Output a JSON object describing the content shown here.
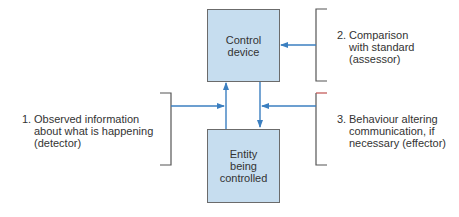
{
  "diagram": {
    "boxes": {
      "control": {
        "label": "Control\ndevice",
        "fill": "#c6ddef"
      },
      "entity": {
        "label": "Entity\nbeing\ncontrolled",
        "fill": "#c6ddef"
      }
    },
    "labels": [
      {
        "number": "1.",
        "text": "Observed information\nabout what is happening\n(detector)"
      },
      {
        "number": "2.",
        "text": "Comparison\nwith standard\n(assessor)"
      },
      {
        "number": "3.",
        "text": "Behaviour altering\ncommunication, if\nnecessary (effector)"
      }
    ],
    "colors": {
      "arrow": "#3b7fc0",
      "bracket": "#555555",
      "box_border": "#6b6b6b",
      "accent_tick": "#c0504d"
    }
  }
}
